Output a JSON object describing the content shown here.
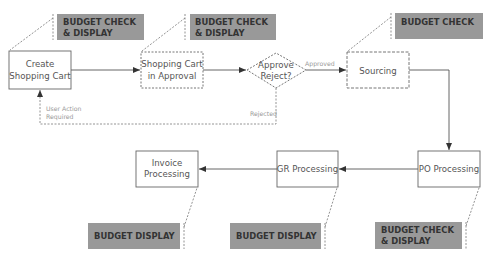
{
  "diagram": {
    "type": "process-flow",
    "colors": {
      "budget_box_fill": "#999999",
      "budget_text": "#333333",
      "node_stroke": "#666666",
      "node_text": "#555555",
      "edge": "#555555",
      "dashed_edge": "#888888",
      "edge_label": "#999999"
    },
    "nodes": [
      {
        "id": "create",
        "lines": [
          "Create",
          "Shopping Cart"
        ],
        "style": "solid"
      },
      {
        "id": "approval",
        "lines": [
          "Shopping Cart",
          "in Approval"
        ],
        "style": "dashed"
      },
      {
        "id": "decision",
        "lines": [
          "Approve",
          "Reject?"
        ],
        "style": "dashed-diamond"
      },
      {
        "id": "sourcing",
        "lines": [
          "Sourcing"
        ],
        "style": "dashed"
      },
      {
        "id": "po",
        "lines": [
          "PO Processing"
        ],
        "style": "solid"
      },
      {
        "id": "gr",
        "lines": [
          "GR Processing"
        ],
        "style": "solid"
      },
      {
        "id": "invoice",
        "lines": [
          "Invoice",
          "Processing"
        ],
        "style": "solid"
      }
    ],
    "budget_annotations": [
      {
        "attached_to": "create",
        "lines": [
          "BUDGET CHECK",
          "& DISPLAY"
        ]
      },
      {
        "attached_to": "approval",
        "lines": [
          "BUDGET CHECK",
          "& DISPLAY"
        ]
      },
      {
        "attached_to": "sourcing",
        "lines": [
          "BUDGET CHECK"
        ]
      },
      {
        "attached_to": "po",
        "lines": [
          "BUDGET CHECK",
          "& DISPLAY"
        ]
      },
      {
        "attached_to": "gr",
        "lines": [
          "BUDGET DISPLAY"
        ]
      },
      {
        "attached_to": "invoice",
        "lines": [
          "BUDGET DISPLAY"
        ]
      }
    ],
    "edges": [
      {
        "from": "create",
        "to": "approval",
        "label": ""
      },
      {
        "from": "approval",
        "to": "decision",
        "label": ""
      },
      {
        "from": "decision",
        "to": "sourcing",
        "label": "Approved"
      },
      {
        "from": "decision",
        "to": "create",
        "label": "Rejected",
        "style": "dashed"
      },
      {
        "from": "decision",
        "to": "create",
        "label": "User Action Required",
        "label_lines": [
          "User Action",
          "Required"
        ],
        "style": "dashed"
      },
      {
        "from": "sourcing",
        "to": "po",
        "label": ""
      },
      {
        "from": "po",
        "to": "gr",
        "label": ""
      },
      {
        "from": "gr",
        "to": "invoice",
        "label": ""
      }
    ]
  }
}
